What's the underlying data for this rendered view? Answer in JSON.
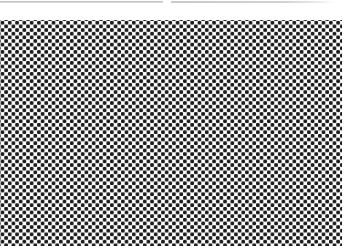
{
  "window": {
    "title": "",
    "width": 350,
    "height": 246,
    "background_color": "#ffffff"
  },
  "divider": {
    "name": "top-divider-rule",
    "color": "#c9c9c9",
    "segments": [
      {
        "label": "",
        "x": 0,
        "width": 163
      },
      {
        "label": "",
        "x": 171,
        "width": 162
      }
    ],
    "gap_x": 163,
    "gap_width": 8
  },
  "gap_band": {
    "label": "",
    "color": "#ffffff"
  },
  "pattern_panel": {
    "name": "polka-dot-pattern",
    "label": "",
    "description": "",
    "dot_color": "#1c1c1c",
    "background_color": "#ffffff",
    "dot_radius_px": 1.85,
    "spacing_px": 7.3,
    "layout": "staggered",
    "x": 0,
    "y": 20,
    "width": 342,
    "height": 226
  },
  "right_margin": {
    "label": "",
    "color": "#ffffff",
    "width": 8
  }
}
